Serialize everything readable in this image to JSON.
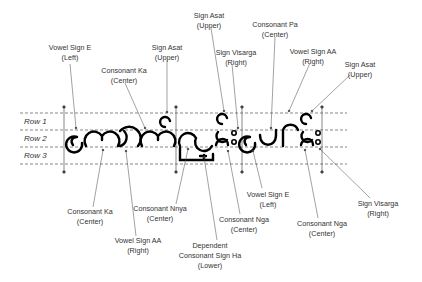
{
  "rows": [
    {
      "label": "Row 1"
    },
    {
      "label": "Row 2"
    },
    {
      "label": "Row 3"
    }
  ],
  "annotations": [
    {
      "name": "Vowel Sign E",
      "pos": "(Left)",
      "x": 70,
      "y": 50
    },
    {
      "name": "Consonant Ka",
      "pos": "(Center)",
      "x": 119,
      "y": 68
    },
    {
      "name": "Sign Asat",
      "pos": "(Upper)",
      "x": 167,
      "y": 45
    },
    {
      "name": "Sign Asat",
      "pos": "(Upper)",
      "x": 207,
      "y": 13
    },
    {
      "name": "Consonant Pa",
      "pos": "(Center)",
      "x": 275,
      "y": 22
    },
    {
      "name": "Sign Visarga",
      "pos": "(Right)",
      "x": 236,
      "y": 50
    },
    {
      "name": "Vowel Sign AA",
      "pos": "(Right)",
      "x": 312,
      "y": 49
    },
    {
      "name": "Sign Asat",
      "pos": "(Upper)",
      "x": 360,
      "y": 60
    },
    {
      "name": "Consonant Ka",
      "pos": "(Center)",
      "x": 91,
      "y": 209
    },
    {
      "name": "Vowel Sign AA",
      "pos": "(Right)",
      "x": 138,
      "y": 237
    },
    {
      "name": "Consonant Nnya",
      "pos": "(Center)",
      "x": 160,
      "y": 206
    },
    {
      "name": "Dependent Consonant Sign Ha",
      "pos": "(Lower)",
      "x": 213,
      "y": 242,
      "multiline": [
        "Dependent",
        "Consonant Sign Ha",
        "(Lower)"
      ]
    },
    {
      "name": "Consonant Nga",
      "pos": "(Center)",
      "x": 244,
      "y": 217
    },
    {
      "name": "Vowel Sign E",
      "pos": "(Left)",
      "x": 268,
      "y": 191
    },
    {
      "name": "Consonant Nga",
      "pos": "(Center)",
      "x": 322,
      "y": 221
    },
    {
      "name": "Sign Visarga",
      "pos": "(Right)",
      "x": 378,
      "y": 201
    }
  ],
  "glyph_text": "ကောက်ညှင်းပေါင်း"
}
